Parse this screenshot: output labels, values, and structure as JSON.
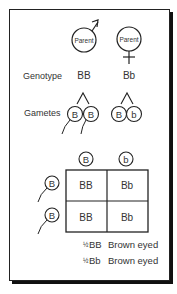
{
  "parents": {
    "male": {
      "label": "Parent",
      "symbol": "male-symbol",
      "genotype": "BB",
      "gametes": [
        "B",
        "B"
      ]
    },
    "female": {
      "label": "Parent",
      "symbol": "female-symbol",
      "genotype": "Bb",
      "gametes": [
        "B",
        "b"
      ]
    }
  },
  "row_labels": {
    "genotype": "Genotype",
    "gametes": "Gametes"
  },
  "punnett": {
    "column_gametes": [
      "B",
      "b"
    ],
    "row_gametes": [
      "B",
      "B"
    ],
    "cells": [
      [
        "BB",
        "Bb"
      ],
      [
        "BB",
        "Bb"
      ]
    ]
  },
  "results": [
    {
      "fraction": "½",
      "genotype": "BB",
      "phenotype": "Brown eyed"
    },
    {
      "fraction": "½",
      "genotype": "Bb",
      "phenotype": "Brown eyed"
    }
  ]
}
